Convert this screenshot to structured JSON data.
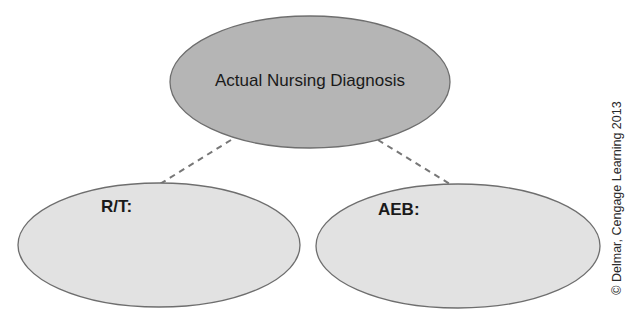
{
  "diagram": {
    "nodes": [
      {
        "id": "top",
        "label": "Actual Nursing Diagnosis",
        "fill": "#b5b5b5"
      },
      {
        "id": "rt",
        "label": "R/T:",
        "fill": "#e2e2e2"
      },
      {
        "id": "aeb",
        "label": "AEB:",
        "fill": "#e2e2e2"
      }
    ],
    "edges": [
      {
        "from": "top",
        "to": "rt",
        "style": "dashed"
      },
      {
        "from": "top",
        "to": "aeb",
        "style": "dashed"
      }
    ],
    "copyright": "© Delmar, Cengage Learning 2013"
  },
  "colors": {
    "stroke": "#6e6e6e",
    "top_fill": "#b5b5b5",
    "child_fill": "#e2e2e2"
  }
}
